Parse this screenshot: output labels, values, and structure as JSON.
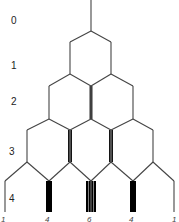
{
  "diagram": {
    "row_labels": [
      "0",
      "1",
      "2",
      "3",
      "4"
    ],
    "bottom_counts": [
      "1",
      "4",
      "6",
      "4",
      "1"
    ],
    "rows": [
      {
        "label": "0",
        "counts": [
          1
        ]
      },
      {
        "label": "1",
        "counts": [
          1,
          1
        ]
      },
      {
        "label": "2",
        "counts": [
          1,
          2,
          1
        ]
      },
      {
        "label": "3",
        "counts": [
          1,
          3,
          3,
          1
        ]
      },
      {
        "label": "4",
        "counts": [
          1,
          4,
          6,
          4,
          1
        ]
      }
    ],
    "colors": {
      "line": "#444444",
      "thick": "#000000",
      "background": "#ffffff"
    }
  }
}
